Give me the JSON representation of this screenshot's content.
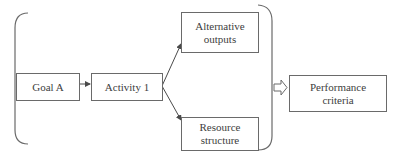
{
  "diagram": {
    "type": "flowchart",
    "nodes": [
      {
        "id": "goal_a",
        "label": "Goal A"
      },
      {
        "id": "activity_1",
        "label": "Activity 1"
      },
      {
        "id": "alternative_outputs",
        "label": "Alternative outputs"
      },
      {
        "id": "resource_structure",
        "label": "Resource structure"
      },
      {
        "id": "performance_criteria",
        "label": "Performance criteria"
      }
    ],
    "edges": [
      {
        "from": "goal_a",
        "to": "activity_1",
        "style": "solid-arrow"
      },
      {
        "from": "activity_1",
        "to": "alternative_outputs",
        "style": "solid-arrow"
      },
      {
        "from": "activity_1",
        "to": "resource_structure",
        "style": "solid-arrow"
      },
      {
        "from": "group",
        "to": "performance_criteria",
        "style": "hollow-block-arrow"
      }
    ],
    "group": {
      "members": [
        "goal_a",
        "activity_1",
        "alternative_outputs",
        "resource_structure"
      ],
      "enclosure": "brackets"
    }
  },
  "labels": {
    "goal_a": "Goal A",
    "activity_1": "Activity 1",
    "alternative_outputs_line1": "Alternative",
    "alternative_outputs_line2": "outputs",
    "resource_structure_line1": "Resource",
    "resource_structure_line2": "structure",
    "performance_criteria_line1": "Performance",
    "performance_criteria_line2": "criteria"
  },
  "colors": {
    "stroke": "#6a6a6a",
    "text": "#404040",
    "background": "#ffffff"
  }
}
